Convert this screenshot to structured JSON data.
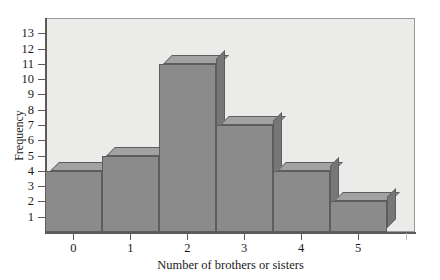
{
  "chart_data": {
    "type": "bar",
    "title": "",
    "subtitle": "",
    "xlabel": "Number of brothers or sisters",
    "ylabel": "Frequency",
    "categories": [
      "0",
      "1",
      "2",
      "3",
      "4",
      "5"
    ],
    "values": [
      4,
      5,
      11,
      7,
      4,
      2
    ],
    "series": [
      {
        "name": "Frequency",
        "values": [
          4,
          5,
          11,
          7,
          4,
          2
        ]
      }
    ],
    "x_tick_labels": [
      "0",
      "1",
      "2",
      "3",
      "4",
      "5"
    ],
    "y_tick_labels": [
      "1",
      "2",
      "3",
      "4",
      "5",
      "6",
      "7",
      "8",
      "9",
      "10",
      "11",
      "12",
      "13"
    ],
    "y_tick_values": [
      1,
      2,
      3,
      4,
      5,
      6,
      7,
      8,
      9,
      10,
      11,
      12,
      13
    ],
    "xlim": [
      -0.5,
      6.0
    ],
    "ylim": [
      0,
      14
    ],
    "grid": false,
    "legend": false,
    "legend_position": "none",
    "bar_style": "3d-block-contiguous-histogram",
    "annotations": [],
    "colors": {
      "plot_background": "#ebebe9",
      "page_background": "#ffffff",
      "bar_front": "#8b8b8b",
      "bar_top": "#a2a2a2",
      "bar_side": "#777777",
      "bar_outline": "#5d5d5d",
      "axis": "#5a5a5a",
      "text": "#1a1a1a"
    }
  }
}
